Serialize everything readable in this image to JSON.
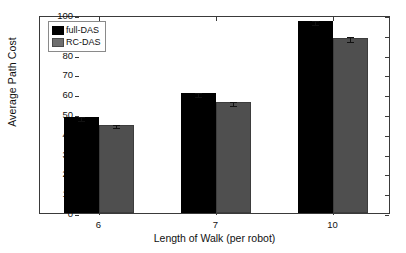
{
  "chart_data": {
    "type": "bar",
    "title": "",
    "xlabel": "Length of Walk (per robot)",
    "ylabel": "Average Path Cost",
    "categories": [
      "6",
      "7",
      "10"
    ],
    "ylim": [
      0,
      100
    ],
    "yticks": [
      0,
      10,
      20,
      30,
      40,
      50,
      60,
      70,
      80,
      90,
      100
    ],
    "grid": false,
    "legend_position": "upper left",
    "series": [
      {
        "name": "full-DAS",
        "color": "#000000",
        "values": [
          48.5,
          60.5,
          97.0
        ],
        "errors": [
          0.8,
          0.9,
          1.0
        ]
      },
      {
        "name": "RC-DAS",
        "color": "#4f4f4f",
        "values": [
          44.5,
          56.0,
          88.5
        ],
        "errors": [
          0.8,
          0.9,
          1.2
        ]
      }
    ]
  }
}
